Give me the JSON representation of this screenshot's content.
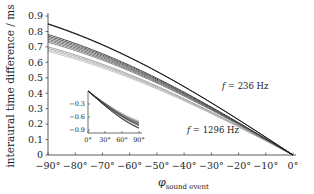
{
  "chart_data": {
    "type": "line",
    "title": "",
    "xlabel": "φ_sound event",
    "xlabel_main": "φ",
    "xlabel_sub": "sound event",
    "ylabel": "interaural time difference / ms",
    "xlim": [
      -90,
      0
    ],
    "ylim": [
      0,
      0.9
    ],
    "grid": false,
    "x_ticks": [
      -90,
      -80,
      -70,
      -60,
      -50,
      -40,
      -30,
      -20,
      -10,
      0
    ],
    "x_tick_labels": [
      "−90°",
      "−80°",
      "−70°",
      "−60°",
      "−50°",
      "−40°",
      "−30°",
      "−20°",
      "−10°",
      "0°"
    ],
    "y_ticks": [
      0,
      0.1,
      0.2,
      0.3,
      0.4,
      0.5,
      0.6,
      0.7,
      0.8,
      0.9
    ],
    "y_tick_labels": [
      "0",
      "0.1",
      "0.2",
      "0.3",
      "0.4",
      "0.5",
      "0.6",
      "0.7",
      "0.8",
      "0.9"
    ],
    "annotations": [
      {
        "text": "f = 236 Hz",
        "italic_part": "f",
        "rest": " = 236 Hz",
        "x": -30,
        "y": 0.52
      },
      {
        "text": "f = 1296 Hz",
        "italic_part": "f",
        "rest": " = 1296 Hz",
        "x": -35,
        "y": 0.25
      }
    ],
    "series_note": "Family of curves for frequencies from 236 Hz (darkest) to 1296 Hz (lightest); ITD at -90° listed, all curves converge to 0 at 0°",
    "series": [
      {
        "name": "f = 236 Hz",
        "itd_at_-90": 0.85,
        "color": "#111111"
      },
      {
        "name": "curve 2",
        "itd_at_-90": 0.847,
        "color": "#1c1c1c"
      },
      {
        "name": "curve 3",
        "itd_at_-90": 0.78,
        "color": "#333333"
      },
      {
        "name": "curve 4",
        "itd_at_-90": 0.77,
        "color": "#444444"
      },
      {
        "name": "curve 5",
        "itd_at_-90": 0.76,
        "color": "#555555"
      },
      {
        "name": "curve 6",
        "itd_at_-90": 0.75,
        "color": "#5e5e5e"
      },
      {
        "name": "curve 7",
        "itd_at_-90": 0.74,
        "color": "#666666"
      },
      {
        "name": "curve 8",
        "itd_at_-90": 0.73,
        "color": "#777777"
      },
      {
        "name": "curve 9",
        "itd_at_-90": 0.7,
        "color": "#999999"
      },
      {
        "name": "curve 10",
        "itd_at_-90": 0.69,
        "color": "#a8a8a8"
      },
      {
        "name": "curve 11",
        "itd_at_-90": 0.68,
        "color": "#b5b5b5"
      },
      {
        "name": "f = 1296 Hz",
        "itd_at_-90": 0.67,
        "color": "#c4c4c4"
      }
    ],
    "inset": {
      "type": "line",
      "xlim": [
        0,
        90
      ],
      "ylim": [
        -0.9,
        0
      ],
      "x_ticks": [
        0,
        30,
        60,
        90
      ],
      "x_tick_labels": [
        "0°",
        "30°",
        "60°",
        "90°"
      ],
      "y_ticks": [
        -0.3,
        -0.6,
        -0.9
      ],
      "y_tick_labels": [
        "−0.3",
        "−0.6",
        "−0.9"
      ],
      "series_end_values": [
        -0.86,
        -0.85,
        -0.8,
        -0.78,
        -0.77,
        -0.76,
        -0.74,
        -0.73,
        -0.72,
        -0.71,
        -0.7,
        -0.69
      ]
    }
  }
}
